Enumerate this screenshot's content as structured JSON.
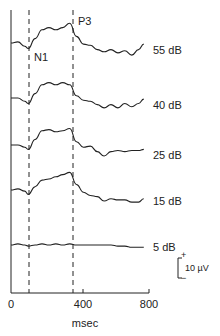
{
  "chart_data": {
    "type": "line",
    "title": "",
    "xlabel": "msec",
    "ylabel": "",
    "xlim": [
      0,
      800
    ],
    "x_ticks": [
      0,
      400,
      800
    ],
    "grid": false,
    "legend": "none",
    "annotations": [
      {
        "label": "N1",
        "x_ms": 100,
        "kind": "dashed-vertical"
      },
      {
        "label": "P3",
        "x_ms": 340,
        "kind": "dashed-vertical"
      }
    ],
    "scale_bar": {
      "label": "10 µV",
      "plus": "+",
      "minus": "−"
    },
    "x": [
      0,
      40,
      80,
      100,
      140,
      180,
      220,
      260,
      300,
      340,
      380,
      420,
      460,
      500,
      540,
      580,
      620,
      660,
      700,
      740,
      770
    ],
    "series": [
      {
        "name": "55 dB",
        "values": [
          0,
          1,
          -3,
          -5,
          4,
          12,
          14,
          12,
          14,
          18,
          6,
          -1,
          -2,
          -6,
          -8,
          -6,
          -9,
          -7,
          -11,
          -6,
          -1
        ]
      },
      {
        "name": "40 dB",
        "values": [
          0,
          0,
          -3,
          -5,
          4,
          12,
          14,
          12,
          14,
          12,
          2,
          -2,
          -3,
          -6,
          -9,
          -6,
          -9,
          -5,
          -8,
          -5,
          -1
        ]
      },
      {
        "name": "25 dB",
        "values": [
          0,
          0,
          -2,
          -4,
          5,
          13,
          14,
          12,
          13,
          15,
          3,
          -2,
          -1,
          -6,
          -10,
          -6,
          -5,
          -6,
          -5,
          -5,
          -4
        ]
      },
      {
        "name": "15 dB",
        "values": [
          0,
          1,
          -1,
          -4,
          3,
          9,
          10,
          12,
          14,
          16,
          5,
          -2,
          -5,
          -6,
          -10,
          -8,
          -9,
          -9,
          -11,
          -11,
          -8
        ]
      },
      {
        "name": "5 dB",
        "values": [
          0,
          1,
          0,
          -1,
          0,
          1,
          0,
          1,
          0,
          1,
          0,
          0,
          0,
          0,
          0,
          0,
          -1,
          -1,
          -2,
          -2,
          -2
        ]
      }
    ]
  },
  "labels": {
    "series": [
      "55 dB",
      "40 dB",
      "25 dB",
      "15 dB",
      "5 dB"
    ],
    "n1": "N1",
    "p3": "P3",
    "x_ticks": [
      "0",
      "400",
      "800"
    ],
    "xlabel": "msec",
    "scale": "10 µV",
    "plus": "+",
    "minus": "−"
  }
}
